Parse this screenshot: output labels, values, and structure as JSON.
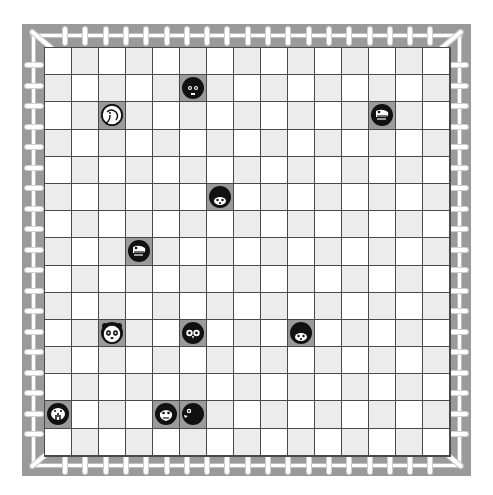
{
  "board": {
    "columns": 15,
    "rows": 15,
    "colors": {
      "frame": "#9a9a9a",
      "cell_light": "#ffffff",
      "cell_alt": "#ececec",
      "cell_occupied": "#9b9b9b",
      "grid_line": "#4a4a4a",
      "piece": "#111111"
    },
    "pieces": [
      {
        "animal": "cat",
        "col": 5,
        "row": 1
      },
      {
        "animal": "elephant",
        "col": 2,
        "row": 2
      },
      {
        "animal": "eagle",
        "col": 12,
        "row": 2
      },
      {
        "animal": "hedgehog",
        "col": 6,
        "row": 5
      },
      {
        "animal": "eagle",
        "col": 3,
        "row": 7
      },
      {
        "animal": "panda",
        "col": 2,
        "row": 10
      },
      {
        "animal": "owl",
        "col": 5,
        "row": 10
      },
      {
        "animal": "hedgehog",
        "col": 9,
        "row": 10
      },
      {
        "animal": "walrus",
        "col": 0,
        "row": 13
      },
      {
        "animal": "monkey",
        "col": 4,
        "row": 13
      },
      {
        "animal": "piranha",
        "col": 5,
        "row": 13
      }
    ]
  }
}
